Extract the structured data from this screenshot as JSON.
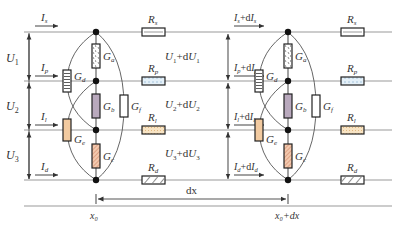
{
  "diagram": {
    "colors": {
      "wire": "#9a9a9a",
      "box_stroke": "#222222",
      "Ga_fill": "#ffffff",
      "Gb_fill": "#b9a9bd",
      "Gc_fill": "#f3c9ae",
      "Gd_fill": "#ffffff",
      "Ge_fill": "#f2caa0",
      "Gf_fill": "#ffffff",
      "Rs_fill": "#ffffff",
      "Rp_fill": "#e4f0f8",
      "Rl_fill": "#f8e4c4",
      "Rd_fill": "#ffffff"
    },
    "left_section": {
      "position_label": "x₀",
      "currents": {
        "s": {
          "base": "I",
          "sub": "s"
        },
        "p": {
          "base": "I",
          "sub": "p"
        },
        "l": {
          "base": "I",
          "sub": "l"
        },
        "d": {
          "base": "I",
          "sub": "d"
        }
      },
      "voltages": [
        {
          "base": "U",
          "sub": "1"
        },
        {
          "base": "U",
          "sub": "2"
        },
        {
          "base": "U",
          "sub": "3"
        }
      ],
      "conductances": {
        "a": {
          "base": "G",
          "sub": "a"
        },
        "b": {
          "base": "G",
          "sub": "b"
        },
        "c": {
          "base": "G",
          "sub": "c"
        },
        "d": {
          "base": "G",
          "sub": "d"
        },
        "e": {
          "base": "G",
          "sub": "e"
        },
        "f": {
          "base": "G",
          "sub": "f"
        }
      },
      "resistances": {
        "s": {
          "base": "R",
          "sub": "s"
        },
        "p": {
          "base": "R",
          "sub": "p"
        },
        "l": {
          "base": "R",
          "sub": "l"
        },
        "d": {
          "base": "R",
          "sub": "d"
        }
      }
    },
    "middle_voltages": [
      {
        "base": "U",
        "sub": "1",
        "tail": "+d",
        "base2": "U",
        "sub2": "1"
      },
      {
        "base": "U",
        "sub": "2",
        "tail": "+d",
        "base2": "U",
        "sub2": "2"
      },
      {
        "base": "U",
        "sub": "3",
        "tail": "+d",
        "base2": "U",
        "sub2": "3"
      }
    ],
    "right_section": {
      "position_label": "x₀+dx",
      "currents": {
        "s": {
          "base": "I",
          "sub": "s",
          "tail": "+d",
          "base2": "I",
          "sub2": "s"
        },
        "p": {
          "base": "I",
          "sub": "p",
          "tail": "+d",
          "base2": "I",
          "sub2": "p"
        },
        "l": {
          "base": "I",
          "sub": "l",
          "tail": "+d",
          "base2": "I",
          "sub2": "l"
        },
        "d": {
          "base": "I",
          "sub": "d",
          "tail": "+d",
          "base2": "I",
          "sub2": "d"
        }
      },
      "conductances": {
        "a": {
          "base": "G",
          "sub": "a"
        },
        "b": {
          "base": "G",
          "sub": "b"
        },
        "c": {
          "base": "G",
          "sub": "c"
        },
        "d": {
          "base": "G",
          "sub": "d"
        },
        "e": {
          "base": "G",
          "sub": "e"
        },
        "f": {
          "base": "G",
          "sub": "f"
        }
      },
      "resistances": {
        "s": {
          "base": "R",
          "sub": "s"
        },
        "p": {
          "base": "R",
          "sub": "p"
        },
        "l": {
          "base": "R",
          "sub": "l"
        },
        "d": {
          "base": "R",
          "sub": "d"
        }
      }
    },
    "dx_label": "dx"
  }
}
